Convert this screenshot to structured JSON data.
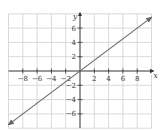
{
  "chart_data": {
    "type": "line",
    "title": "",
    "xlabel": "x",
    "ylabel": "y",
    "xlim": [
      -10,
      10
    ],
    "ylim": [
      -8,
      8
    ],
    "grid": true,
    "grid_step": 2,
    "x_ticks": [
      -8,
      -6,
      -4,
      -2,
      2,
      4,
      6,
      8
    ],
    "y_ticks": [
      -6,
      -4,
      -2,
      2,
      4,
      6
    ],
    "x_tick_labels": [
      "−8",
      "−6",
      "−4",
      "−2",
      "2",
      "4",
      "6",
      "8"
    ],
    "y_tick_labels": [
      "−6",
      "−4",
      "−2",
      "2",
      "4",
      "6"
    ],
    "series": [
      {
        "name": "y = 0.75x",
        "x": [
          -10,
          10
        ],
        "y": [
          -7.5,
          7.5
        ],
        "arrows_both_ends": true
      }
    ],
    "legend": null
  },
  "colors": {
    "grid": "#cfcfcf",
    "axis": "#333333",
    "line": "#666666",
    "background": "#ffffff"
  }
}
